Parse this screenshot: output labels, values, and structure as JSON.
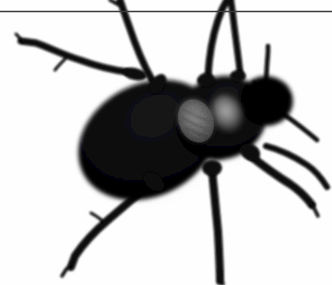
{
  "image": {
    "subject": "black beetle",
    "subject_detail": "darkling beetle photographed from above",
    "view": "dorsal top-down",
    "background_color": "#fefefe",
    "body_color": "#060606",
    "shadow_color": "#bdbdbd",
    "highlight_color": "#9a9a9a",
    "width": 332,
    "height": 285,
    "caption": "Black beetle on white background"
  },
  "overlay": {
    "horizontal_line": {
      "name": "horizontal-rule",
      "color": "#3a3a3e",
      "y": 11,
      "thickness": 1.6,
      "x_start": 0,
      "x_end": 332
    }
  },
  "anatomy": {
    "abdomen": {
      "label": "elytra-abdomen",
      "cx": 148,
      "cy": 140,
      "rx": 72,
      "ry": 55,
      "rotation": -28
    },
    "thorax": {
      "label": "pronotum-thorax",
      "cx": 222,
      "cy": 118,
      "rx": 46,
      "ry": 40,
      "rotation": -25
    },
    "head": {
      "label": "head",
      "cx": 268,
      "cy": 101,
      "rx": 26,
      "ry": 24
    },
    "highlights": [
      {
        "label": "elytra-highlight-left",
        "cx": 196,
        "cy": 120,
        "rx": 18,
        "ry": 22,
        "rotation": -22
      },
      {
        "label": "elytra-highlight-right",
        "cx": 226,
        "cy": 114,
        "rx": 16,
        "ry": 19,
        "rotation": -22
      }
    ],
    "legs": [
      {
        "label": "front-left-leg",
        "path": "M 128 72 C 112 70 96 66 80 60 C 66 56 50 48 36 43 L 20 41",
        "width": 7
      },
      {
        "label": "mid-left-leg",
        "path": "M 150 78 C 140 62 134 44 128 26 C 124 14 122 6 120 0",
        "width": 7
      },
      {
        "label": "front-right-upper-leg",
        "path": "M 206 74 C 208 56 212 38 218 20 C 221 11 224 5 226 0",
        "width": 7
      },
      {
        "label": "mid-right-upper-leg",
        "path": "M 238 70 C 236 52 234 34 232 16 C 231 8 230 3 230 0",
        "width": 7
      },
      {
        "label": "hind-left-leg",
        "path": "M 146 186 C 134 198 120 210 106 222 C 94 232 82 244 74 256 L 70 268",
        "width": 8
      },
      {
        "label": "hind-center-leg",
        "path": "M 212 172 C 214 192 216 212 218 232 C 219 250 220 266 220 280",
        "width": 8
      },
      {
        "label": "mid-right-lower-leg",
        "path": "M 248 156 C 262 166 276 176 290 184 C 298 189 306 196 312 204",
        "width": 8
      },
      {
        "label": "hind-right-leg",
        "path": "M 268 148 C 282 152 296 158 308 166 C 316 172 322 180 326 188",
        "width": 6
      }
    ],
    "antennae": [
      {
        "label": "antenna-upper",
        "path": "M 266 88 C 266 76 267 64 268 52 L 268 46",
        "width": 4
      },
      {
        "label": "antenna-right",
        "path": "M 276 108 C 288 116 300 126 312 136 L 318 141",
        "width": 4
      }
    ],
    "tarsi": [
      {
        "label": "tarsus-front-left",
        "path": "M 24 42 L 16 36",
        "width": 3
      },
      {
        "label": "tarsus-hind-left",
        "path": "M 70 264 L 62 272",
        "width": 3
      },
      {
        "label": "tarsus-hind-center",
        "path": "M 219 272 L 222 282",
        "width": 3
      },
      {
        "label": "tarsus-mid-right",
        "path": "M 310 202 L 318 212",
        "width": 3
      }
    ]
  }
}
